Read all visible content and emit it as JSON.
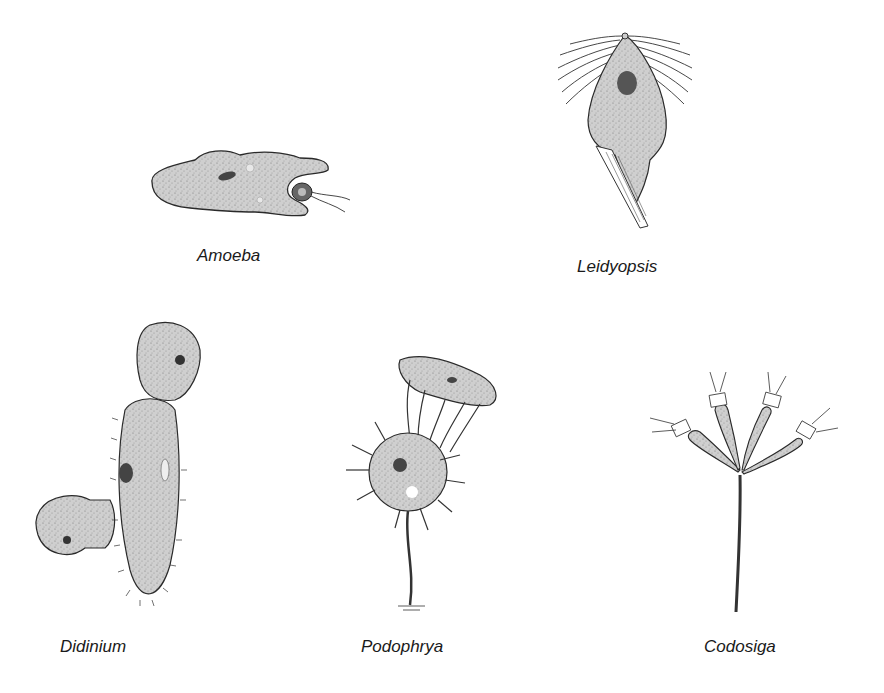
{
  "figure": {
    "background": "#ffffff",
    "fill_color": "#c8c8c8",
    "stroke_color": "#2a2a2a",
    "organisms": [
      {
        "name": "Amoeba",
        "description": "amoeboid cell engulfing a flagellated prey cell with pseudopods"
      },
      {
        "name": "Leidyopsis",
        "description": "flagellate with many anterior flagella and a striated axostyle"
      },
      {
        "name": "Didinium",
        "description": "ciliate with two predators attached to a large ciliated prey"
      },
      {
        "name": "Podophrya",
        "description": "stalked suctorian with knobbed tentacles capturing a ciliate"
      },
      {
        "name": "Codosiga",
        "description": "colonial choanoflagellate with four collared cells on a branched stalk"
      }
    ]
  }
}
